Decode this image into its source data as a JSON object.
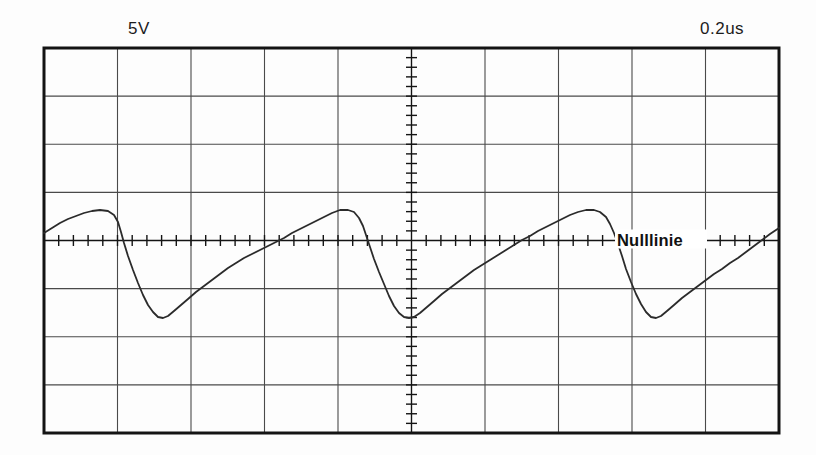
{
  "instrument": {
    "type": "oscilloscope-trace",
    "volts_per_div_label": "5V",
    "time_per_div_label": "0.2us",
    "annotation_label": "Nulllinie",
    "trace_color": "#2b2b2b",
    "grid_color": "#4a4a4a",
    "frame_color": "#141414",
    "background_color": "#ffffff"
  },
  "graticule": {
    "left": 44,
    "top": 48,
    "right": 779,
    "bottom": 433,
    "horizontal_divisions": 10,
    "vertical_divisions": 8,
    "div_width": 73.5,
    "div_height": 48.125,
    "center_x": 411.5,
    "center_y": 240.5,
    "minor_ticks_per_div": 5
  },
  "chart_data": {
    "type": "line",
    "title": "",
    "subtitle": "",
    "xlabel": "Time",
    "ylabel": "Voltage",
    "grid": true,
    "legend_position": "none",
    "x_unit_per_div": "0.2us",
    "y_unit_per_div": "5V",
    "xlim": [
      0,
      10
    ],
    "ylim": [
      -4,
      4
    ],
    "annotations": [
      {
        "text": "Nulllinie",
        "meaning": "zero-line",
        "x_div": 8.2,
        "y_div": 0,
        "px_x": 615,
        "px_y": 240
      }
    ],
    "series": [
      {
        "name": "channel-1",
        "comment": "Sawtooth-like trace: slow rise, sharp fall to negative trough, slow rise again. Points are pixel coordinates (x,y) of the trace in screenshot space.",
        "period_px": 245,
        "peak_px_y": 210,
        "trough_px_y": 318,
        "zero_px_y": 240,
        "points": [
          [
            44,
            233
          ],
          [
            52,
            228
          ],
          [
            60,
            223
          ],
          [
            68,
            219
          ],
          [
            76,
            216
          ],
          [
            84,
            213
          ],
          [
            92,
            211
          ],
          [
            100,
            210
          ],
          [
            108,
            211
          ],
          [
            114,
            215
          ],
          [
            118,
            222
          ],
          [
            121,
            232
          ],
          [
            124,
            243
          ],
          [
            128,
            256
          ],
          [
            133,
            270
          ],
          [
            138,
            283
          ],
          [
            143,
            295
          ],
          [
            148,
            305
          ],
          [
            153,
            312
          ],
          [
            158,
            317
          ],
          [
            163,
            318
          ],
          [
            168,
            316
          ],
          [
            174,
            311
          ],
          [
            181,
            305
          ],
          [
            188,
            299
          ],
          [
            196,
            292
          ],
          [
            204,
            286
          ],
          [
            212,
            280
          ],
          [
            220,
            274
          ],
          [
            228,
            268
          ],
          [
            236,
            263
          ],
          [
            244,
            258
          ],
          [
            252,
            254
          ],
          [
            260,
            250
          ],
          [
            268,
            246
          ],
          [
            276,
            242
          ],
          [
            284,
            238
          ],
          [
            292,
            233
          ],
          [
            300,
            229
          ],
          [
            308,
            225
          ],
          [
            316,
            221
          ],
          [
            324,
            217
          ],
          [
            332,
            213
          ],
          [
            340,
            210
          ],
          [
            348,
            210
          ],
          [
            354,
            212
          ],
          [
            359,
            218
          ],
          [
            363,
            226
          ],
          [
            366,
            235
          ],
          [
            370,
            247
          ],
          [
            374,
            259
          ],
          [
            379,
            272
          ],
          [
            384,
            284
          ],
          [
            389,
            296
          ],
          [
            394,
            306
          ],
          [
            399,
            313
          ],
          [
            404,
            317
          ],
          [
            409,
            318
          ],
          [
            414,
            317
          ],
          [
            420,
            313
          ],
          [
            427,
            307
          ],
          [
            434,
            301
          ],
          [
            442,
            294
          ],
          [
            450,
            288
          ],
          [
            458,
            282
          ],
          [
            466,
            276
          ],
          [
            474,
            270
          ],
          [
            482,
            265
          ],
          [
            490,
            260
          ],
          [
            498,
            255
          ],
          [
            506,
            250
          ],
          [
            514,
            245
          ],
          [
            522,
            240
          ],
          [
            530,
            236
          ],
          [
            538,
            231
          ],
          [
            546,
            227
          ],
          [
            554,
            223
          ],
          [
            562,
            219
          ],
          [
            570,
            215
          ],
          [
            578,
            212
          ],
          [
            586,
            210
          ],
          [
            594,
            210
          ],
          [
            600,
            212
          ],
          [
            606,
            217
          ],
          [
            610,
            224
          ],
          [
            614,
            233
          ],
          [
            618,
            244
          ],
          [
            622,
            256
          ],
          [
            626,
            269
          ],
          [
            631,
            282
          ],
          [
            636,
            294
          ],
          [
            641,
            304
          ],
          [
            646,
            312
          ],
          [
            651,
            317
          ],
          [
            656,
            318
          ],
          [
            661,
            316
          ],
          [
            667,
            311
          ],
          [
            674,
            305
          ],
          [
            682,
            298
          ],
          [
            690,
            292
          ],
          [
            698,
            286
          ],
          [
            706,
            280
          ],
          [
            714,
            274
          ],
          [
            722,
            269
          ],
          [
            730,
            263
          ],
          [
            738,
            258
          ],
          [
            746,
            252
          ],
          [
            754,
            246
          ],
          [
            762,
            240
          ],
          [
            770,
            234
          ],
          [
            779,
            228
          ]
        ]
      }
    ]
  }
}
